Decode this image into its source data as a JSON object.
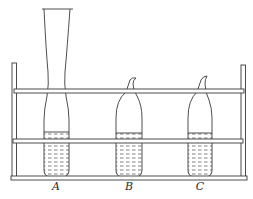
{
  "figure": {
    "type": "line-diagram",
    "colors": {
      "line": "#3a3a3a",
      "background": "#ffffff"
    }
  },
  "tubes": [
    {
      "label": "A",
      "shape": "open tube with flared funnel top and narrowed neck",
      "liquid": "filled to about lower third"
    },
    {
      "label": "B",
      "shape": "sealed tube with drawn-out hooked tip",
      "liquid": "filled to about lower third"
    },
    {
      "label": "C",
      "shape": "sealed tube with drawn-out hooked tip",
      "liquid": "filled to about lower third"
    }
  ]
}
